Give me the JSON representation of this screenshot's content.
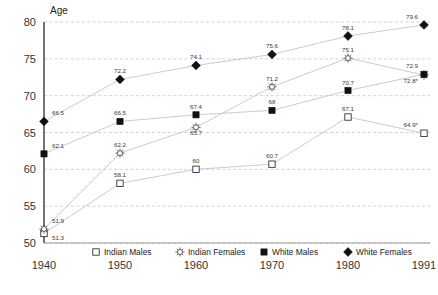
{
  "chart_data": {
    "type": "line",
    "title": "",
    "xlabel": "",
    "ylabel": "Age",
    "x": [
      "1940",
      "1950",
      "1960",
      "1970",
      "1980",
      "1991"
    ],
    "categories": [
      "1940",
      "1950",
      "1960",
      "1970",
      "1980",
      "1991"
    ],
    "ylim": [
      50,
      80
    ],
    "yticks": [
      "50",
      "55",
      "60",
      "65",
      "70",
      "75",
      "80"
    ],
    "grid": true,
    "legend_position": "bottom",
    "series": [
      {
        "name": "Indian Males",
        "marker": "open-square",
        "values": [
          51.3,
          58.1,
          60,
          60.7,
          67.1,
          64.9
        ],
        "labels": [
          "51.3",
          "58.1",
          "60",
          "60.7",
          "67.1",
          "64.9*"
        ]
      },
      {
        "name": "Indian Females",
        "marker": "open-sunburst",
        "values": [
          51.9,
          62.2,
          65.7,
          71.2,
          75.1,
          72.8
        ],
        "labels": [
          "51.9",
          "62.2",
          "65.7",
          "71.2",
          "75.1",
          "72.8*"
        ]
      },
      {
        "name": "White Males",
        "marker": "filled-square",
        "values": [
          62.1,
          66.5,
          67.4,
          68,
          70.7,
          72.9
        ],
        "labels": [
          "62.1",
          "66.5",
          "67.4",
          "68",
          "70.7",
          "72.9"
        ]
      },
      {
        "name": "White Females",
        "marker": "filled-diamond",
        "values": [
          66.5,
          72.2,
          74.1,
          75.6,
          78.1,
          79.6
        ],
        "labels": [
          "66.5",
          "72.2",
          "74.1",
          "75.6",
          "78.1",
          "79.6"
        ]
      }
    ]
  },
  "legend": {
    "items": [
      {
        "label": "Indian Males",
        "marker": "open-square"
      },
      {
        "label": "Indian Females",
        "marker": "open-sunburst"
      },
      {
        "label": "White Males",
        "marker": "filled-square"
      },
      {
        "label": "White Females",
        "marker": "filled-diamond"
      }
    ]
  },
  "axes": {
    "y_title": "Age",
    "y_ticks": [
      "80",
      "75",
      "70",
      "65",
      "60",
      "55",
      "50"
    ],
    "x_ticks": [
      "1940",
      "1950",
      "1960",
      "1970",
      "1980",
      "1991"
    ]
  }
}
